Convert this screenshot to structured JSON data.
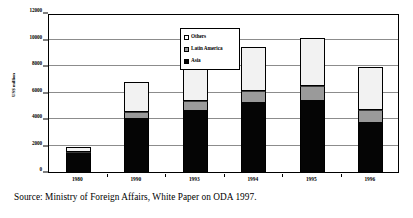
{
  "chart_data": {
    "type": "bar",
    "stacked": true,
    "title": "",
    "xlabel": "",
    "ylabel": "US$ million",
    "ylim": [
      0,
      12000
    ],
    "ytick_labels": [
      "0",
      "2000",
      "4000",
      "6000",
      "8000",
      "10000",
      "12000"
    ],
    "ytick_values": [
      0,
      2000,
      4000,
      6000,
      8000,
      10000,
      12000
    ],
    "grid": true,
    "legend_position": "inside-top-center",
    "categories": [
      "1980",
      "1990",
      "1993",
      "1994",
      "1995",
      "1996"
    ],
    "series": [
      {
        "name": "Asia",
        "color": "#050505",
        "values": [
          1400,
          4100,
          4650,
          5250,
          5400,
          3750
        ]
      },
      {
        "name": "Latin America",
        "color": "#9a9a9a",
        "values": [
          100,
          400,
          700,
          850,
          1100,
          900
        ]
      },
      {
        "name": "Others",
        "color": "#f2f2f2",
        "values": [
          400,
          2300,
          2600,
          3300,
          3650,
          3300
        ]
      }
    ],
    "totals": [
      1900,
      6800,
      7950,
      9400,
      10150,
      7950
    ]
  },
  "legend": {
    "items": [
      {
        "label": "Others",
        "marker": "square-white-icon"
      },
      {
        "label": "Latin America",
        "marker": "square-gray-icon"
      },
      {
        "label": "Asia",
        "marker": "square-black-icon"
      }
    ]
  },
  "caption": {
    "text": "Source: Ministry of Foreign Affairs, White Paper on ODA 1997."
  }
}
